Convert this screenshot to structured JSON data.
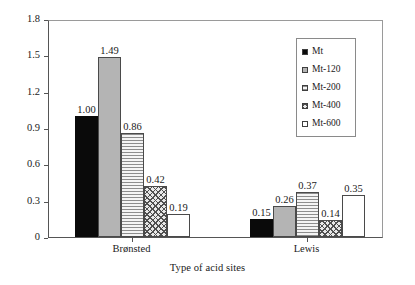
{
  "chart_data": {
    "type": "bar",
    "title": "",
    "xlabel": "Type of acid sites",
    "ylabel": "Concentration of acid sites (mmol/g)",
    "categories": [
      "Brønsted",
      "Lewis"
    ],
    "ylim": [
      0,
      1.8
    ],
    "yticks": [
      "0",
      "0.3",
      "0.6",
      "0.9",
      "1.2",
      "1.5",
      "1.8"
    ],
    "ytick_values": [
      0,
      0.3,
      0.6,
      0.9,
      1.2,
      1.5,
      1.8
    ],
    "grid": false,
    "legend_position": "top-right",
    "series": [
      {
        "name": "Mt",
        "fill": "solid-black",
        "values": [
          1.0,
          0.15
        ],
        "labels": [
          "1.00",
          "0.15"
        ]
      },
      {
        "name": "Mt-120",
        "fill": "solid-gray",
        "values": [
          1.49,
          0.26
        ],
        "labels": [
          "1.49",
          "0.26"
        ]
      },
      {
        "name": "Mt-200",
        "fill": "hlines",
        "values": [
          0.86,
          0.37
        ],
        "labels": [
          "0.86",
          "0.37"
        ]
      },
      {
        "name": "Mt-400",
        "fill": "crosshatch",
        "values": [
          0.42,
          0.14
        ],
        "labels": [
          "0.42",
          "0.14"
        ]
      },
      {
        "name": "Mt-600",
        "fill": "white",
        "values": [
          0.19,
          0.35
        ],
        "labels": [
          "0.19",
          "0.35"
        ]
      }
    ]
  },
  "legend": {
    "items": [
      {
        "label": "Mt",
        "fill": "solid-black"
      },
      {
        "label": "Mt-120",
        "fill": "solid-gray"
      },
      {
        "label": "Mt-200",
        "fill": "hlines"
      },
      {
        "label": "Mt-400",
        "fill": "crosshatch"
      },
      {
        "label": "Mt-600",
        "fill": "white"
      }
    ]
  },
  "colors": {
    "axis": "#555555",
    "frame": "#9a9a9a",
    "text": "#1a1a1a",
    "series_black": "#0a0a0a",
    "series_gray": "#b4b4b4",
    "series_white": "#ffffff"
  }
}
